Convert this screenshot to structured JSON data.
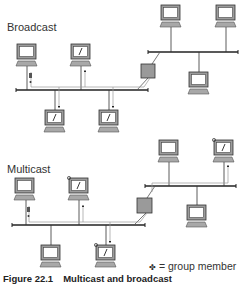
{
  "figure": {
    "sections": [
      {
        "title": "Broadcast"
      },
      {
        "title": "Multicast"
      }
    ],
    "legend": {
      "symbol": "✤",
      "text": "= group member"
    },
    "caption": {
      "number": "Figure 22.1",
      "title": "Multicast and broadcast"
    },
    "icons": {
      "host": "computer-icon",
      "router": "router-icon",
      "member_marker": "group-member-icon"
    },
    "colors": {
      "line": "#222222",
      "screen_fill": "#ffffff",
      "device_fill": "#a8a8a8",
      "router_fill": "#9a9a9a",
      "arrow_line": "#999999"
    }
  }
}
